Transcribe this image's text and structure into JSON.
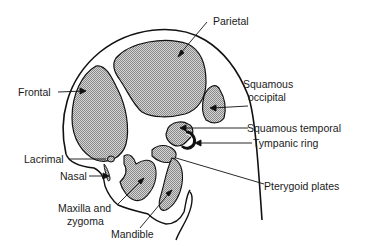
{
  "diagram": {
    "colors": {
      "outline": "#111111",
      "bone_fill": "#b5b5b5",
      "background": "#ffffff"
    },
    "labels": {
      "parietal": "Parietal",
      "frontal": "Frontal",
      "squamous_occipital_line1": "Squamous",
      "squamous_occipital_line2": "occipital",
      "squamous_temporal": "Squamous temporal",
      "tympanic_ring": "Tympanic ring",
      "lacrimal": "Lacrimal",
      "nasal": "Nasal",
      "pterygoid_plates": "Pterygoid plates",
      "maxilla_line1": "Maxilla and",
      "maxilla_line2": "zygoma",
      "mandible": "Mandible"
    }
  }
}
